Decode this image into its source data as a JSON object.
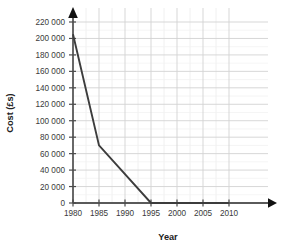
{
  "chart_data": {
    "type": "line",
    "title": "",
    "xlabel": "Year",
    "ylabel": "Cost (£s)",
    "x": [
      1980,
      1985,
      1995,
      2010
    ],
    "values": [
      205000,
      70000,
      0,
      0
    ],
    "series": [
      {
        "name": "Cost",
        "x": [
          1980,
          1985,
          1995,
          2010
        ],
        "values": [
          205000,
          70000,
          0,
          0
        ]
      }
    ],
    "xlim": [
      1980,
      2010
    ],
    "ylim": [
      0,
      220000
    ],
    "xtick_labels": [
      "1980",
      "1985",
      "1990",
      "1995",
      "2000",
      "2005",
      "2010"
    ],
    "xtick_values": [
      1980,
      1985,
      1990,
      1995,
      2000,
      2005,
      2010
    ],
    "ytick_labels": [
      "0",
      "20 000",
      "40 000",
      "60 000",
      "80 000",
      "100 000",
      "120 000",
      "140 000",
      "160 000",
      "180 000",
      "200 000",
      "220 000"
    ],
    "ytick_values": [
      0,
      20000,
      40000,
      60000,
      80000,
      100000,
      120000,
      140000,
      160000,
      180000,
      200000,
      220000
    ],
    "grid": true,
    "minor_grid": true,
    "x_minor_step": 2.5,
    "y_minor_step": 20000,
    "legend": "none",
    "line_color": "#3c3c3c",
    "grid_color": "#d9d9d9",
    "axis_color": "#5a5a5a",
    "background": "#ffffff",
    "x_axis_arrow": true,
    "y_axis_arrow": true
  }
}
